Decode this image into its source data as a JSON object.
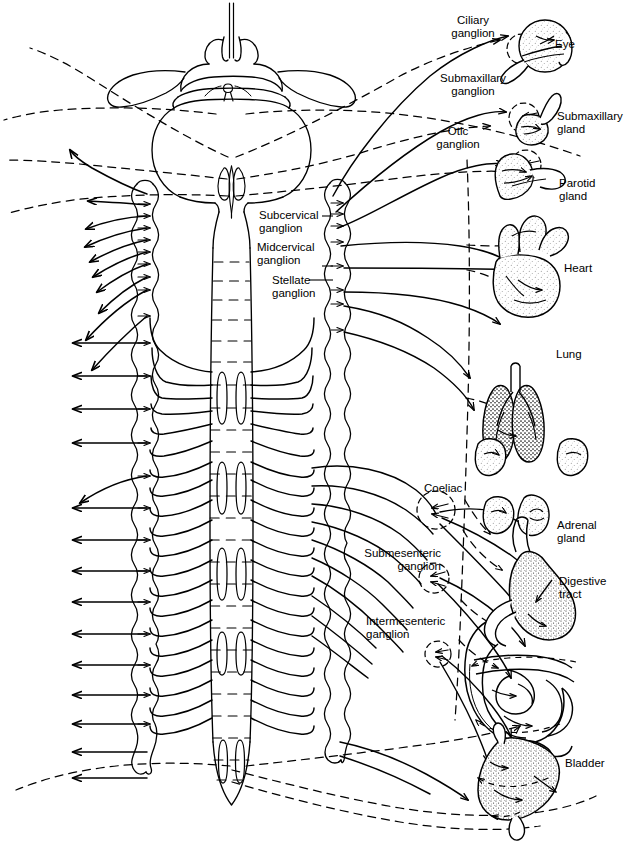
{
  "diagram": {
    "line_colors": {
      "ink": "#000000",
      "background": "#ffffff"
    },
    "line_styles": {
      "sympathetic": "solid",
      "parasympathetic": "dashed"
    }
  },
  "labels": {
    "ciliary_ganglion": "Ciliary\nganglion",
    "eye": "Eye",
    "submaxillary_ganglion": "Submaxillary\nganglion",
    "submaxillary_gland": "Submaxillary\ngland",
    "otic_ganglion": "Otic\nganglion",
    "parotid_gland": "Parotid\ngland",
    "subcervical_ganglion": "Subcervical\nganglion",
    "midcervical_ganglion": "Midcervical\nganglion",
    "stellate_ganglion": "Stellate\nganglion",
    "heart": "Heart",
    "lung": "Lung",
    "coeliac": "Coeliac",
    "adrenal_gland": "Adrenal\ngland",
    "submesenteric_ganglion": "Submesenteric\nganglion",
    "digestive_tract": "Digestive\ntract",
    "intermesenteric_ganglion": "Intermesenteric\nganglion",
    "bladder": "Bladder"
  },
  "structures": {
    "brain": "brain-and-brainstem",
    "spinal_cord": "spinal-cord",
    "left_chain": "left-sympathetic-chain",
    "right_chain": "right-sympathetic-chain",
    "spinal_nerve_count": 22
  }
}
